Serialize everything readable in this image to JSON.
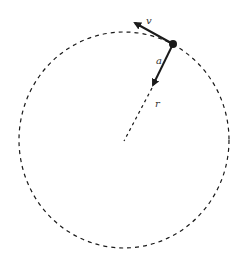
{
  "diagram": {
    "labels": {
      "velocity": "v",
      "acceleration": "a",
      "radius": "r"
    },
    "colors": {
      "stroke": "#1a1a1a",
      "background": "#ffffff"
    }
  }
}
